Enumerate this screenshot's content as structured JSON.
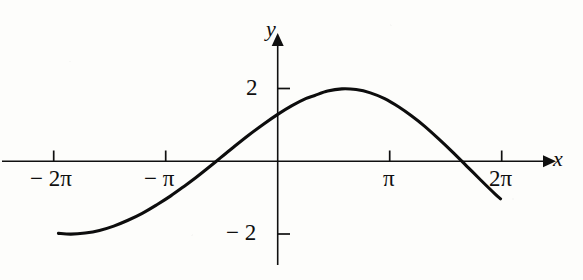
{
  "figure": {
    "title": "",
    "background_color": "#fdfdfb",
    "ink_color": "#101010"
  },
  "axes": {
    "x_axis": {
      "label": "x",
      "label_name": "x-axis-label",
      "has_arrow": true,
      "tick_labels": [
        "− 2π",
        "− π",
        "π",
        "2π"
      ],
      "tick_values": [
        -6.2832,
        -3.1416,
        3.1416,
        6.2832
      ],
      "range": [
        -7.5,
        7.6
      ]
    },
    "y_axis": {
      "label": "y",
      "label_name": "y-axis-label",
      "has_arrow": true,
      "tick_labels": [
        "2",
        "− 2"
      ],
      "tick_values": [
        2,
        -2
      ],
      "range": [
        -3.5,
        3.5
      ]
    },
    "origin_label": ""
  },
  "chart_data": {
    "type": "line",
    "title": "",
    "xlabel": "x",
    "ylabel": "y",
    "xlim": [
      -7.5,
      7.6
    ],
    "ylim": [
      -3.5,
      3.5
    ],
    "grid": false,
    "legend": null,
    "xticks": [
      -6.2832,
      -3.1416,
      3.1416,
      6.2832
    ],
    "xticklabels": [
      "− 2π",
      "− π",
      "π",
      "2π"
    ],
    "yticks": [
      2,
      -2
    ],
    "yticklabels": [
      "2",
      "− 2"
    ],
    "series": [
      {
        "name": "y = 2 cos(x/2 − 0.52)",
        "amplitude": 2,
        "period": 12.1,
        "phase_shift": 1.04,
        "x": [
          -6.15,
          -5.8,
          -5.4,
          -5.0,
          -4.6,
          -4.2,
          -3.8,
          -3.4,
          -3.0,
          -2.6,
          -2.31,
          -2.0,
          -1.6,
          -1.2,
          -0.8,
          -0.4,
          0.0,
          0.4,
          0.8,
          1.04,
          1.4,
          1.8,
          2.2,
          2.6,
          3.0,
          3.4,
          3.75,
          4.1,
          4.5,
          4.9,
          5.3,
          5.7,
          6.1,
          6.25
        ],
        "y": [
          -1.98,
          -2.0,
          -1.97,
          -1.9,
          -1.78,
          -1.62,
          -1.43,
          -1.2,
          -0.95,
          -0.67,
          -0.46,
          -0.22,
          0.1,
          0.42,
          0.73,
          1.02,
          1.29,
          1.53,
          1.73,
          1.81,
          1.93,
          1.99,
          1.97,
          1.88,
          1.72,
          1.49,
          1.25,
          0.98,
          0.63,
          0.26,
          -0.13,
          -0.52,
          -0.9,
          -1.03
        ]
      }
    ],
    "annotations": {
      "maximum": {
        "x": 1.04,
        "y": 2.0
      },
      "minimum": {
        "x": -5.7,
        "y": -2.0
      },
      "zero_crossings": [
        -2.31,
        3.75
      ]
    }
  },
  "labels": {
    "x_tick_neg_2pi": "− 2π",
    "x_tick_neg_pi": "− π",
    "x_tick_pi": "π",
    "x_tick_2pi": "2π",
    "y_tick_pos_2": "2",
    "y_tick_neg_2": "− 2",
    "axis_x": "x",
    "axis_y": "y"
  }
}
